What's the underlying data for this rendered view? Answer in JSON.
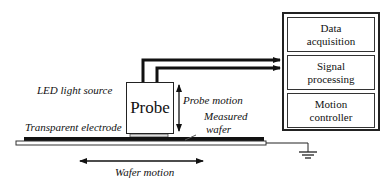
{
  "diagram": {
    "probe": {
      "label": "Probe"
    },
    "labels": {
      "led": "LED light source",
      "probe_motion": "Probe motion",
      "measured_wafer_line1": "Measured",
      "measured_wafer_line2": "wafer",
      "transparent_electrode": "Transparent electrode",
      "wafer_motion": "Wafer motion"
    },
    "controller": {
      "blocks": [
        {
          "line1": "Data",
          "line2": "acquisition"
        },
        {
          "line1": "Signal",
          "line2": "processing"
        },
        {
          "line1": "Motion",
          "line2": "controller"
        }
      ]
    }
  }
}
